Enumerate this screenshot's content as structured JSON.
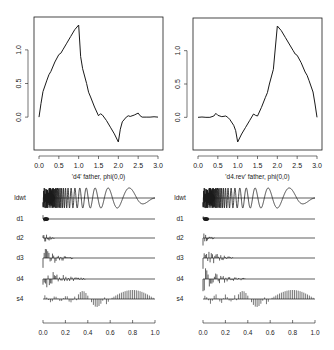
{
  "figure": {
    "background": "#ffffff",
    "ink": "#1a1a1a",
    "panels": [
      {
        "id": "top-left",
        "xlabel": "'d4' father, phi(0,0)"
      },
      {
        "id": "top-right",
        "xlabel": "'d4.rev' father, phi(0,0)"
      },
      {
        "id": "bottom-left",
        "rows": [
          "ldwt",
          "d1",
          "d2",
          "d3",
          "d4",
          "s4"
        ]
      },
      {
        "id": "bottom-right",
        "rows": [
          "ldwt",
          "d1",
          "d2",
          "d3",
          "d4",
          "s4"
        ]
      }
    ]
  },
  "chart_data": [
    {
      "type": "line",
      "title": "",
      "xlabel": "'d4' father, phi(0,0)",
      "ylabel": "",
      "xlim": [
        0,
        3
      ],
      "ylim": [
        -0.4,
        1.4
      ],
      "xticks": [
        "0.0",
        "0.5",
        "1.0",
        "1.5",
        "2.0",
        "2.5",
        "3.0"
      ],
      "yticks": [
        "0.0",
        "0.5",
        "1.0"
      ],
      "grid": false,
      "x": [
        0.0,
        0.05,
        0.1,
        0.2,
        0.25,
        0.3,
        0.4,
        0.5,
        0.55,
        0.6,
        0.7,
        0.8,
        0.9,
        1.0,
        1.05,
        1.1,
        1.2,
        1.25,
        1.3,
        1.4,
        1.5,
        1.55,
        1.6,
        1.7,
        1.8,
        1.9,
        2.0,
        2.05,
        2.1,
        2.2,
        2.25,
        2.3,
        2.4,
        2.5,
        2.55,
        2.6,
        2.7,
        2.8,
        2.9,
        3.0
      ],
      "y": [
        0.0,
        0.2,
        0.38,
        0.55,
        0.63,
        0.68,
        0.82,
        0.93,
        0.95,
        1.0,
        1.1,
        1.2,
        1.3,
        1.37,
        0.9,
        0.72,
        0.5,
        0.37,
        0.3,
        0.15,
        0.02,
        0.05,
        0.03,
        -0.05,
        -0.15,
        -0.25,
        -0.37,
        -0.18,
        -0.07,
        0.0,
        0.02,
        0.01,
        0.03,
        0.06,
        0.02,
        0.0,
        0.0,
        0.0,
        0.005,
        0.0
      ]
    },
    {
      "type": "line",
      "title": "",
      "xlabel": "'d4.rev' father, phi(0,0)",
      "ylabel": "",
      "xlim": [
        0,
        3
      ],
      "ylim": [
        -0.4,
        1.4
      ],
      "xticks": [
        "0.0",
        "0.5",
        "1.0",
        "1.5",
        "2.0",
        "2.5",
        "3.0"
      ],
      "yticks": [
        "0.0",
        "0.5",
        "1.0"
      ],
      "grid": false,
      "x": [
        0.0,
        0.1,
        0.2,
        0.3,
        0.4,
        0.45,
        0.5,
        0.6,
        0.7,
        0.75,
        0.8,
        0.9,
        0.95,
        1.0,
        1.1,
        1.2,
        1.3,
        1.4,
        1.45,
        1.5,
        1.6,
        1.7,
        1.75,
        1.8,
        1.9,
        2.0,
        2.1,
        2.2,
        2.3,
        2.4,
        2.45,
        2.5,
        2.6,
        2.7,
        2.75,
        2.8,
        2.9,
        2.95,
        3.0
      ],
      "y": [
        0.0,
        0.005,
        0.0,
        0.0,
        0.02,
        0.06,
        0.03,
        0.01,
        0.02,
        0.0,
        -0.03,
        -0.12,
        -0.2,
        -0.37,
        -0.25,
        -0.15,
        -0.05,
        0.05,
        0.03,
        0.02,
        0.15,
        0.3,
        0.37,
        0.5,
        0.72,
        1.37,
        1.3,
        1.2,
        1.1,
        1.0,
        0.95,
        0.93,
        0.82,
        0.68,
        0.63,
        0.55,
        0.38,
        0.2,
        0.0
      ]
    },
    {
      "type": "multiresolution",
      "title": "",
      "xlabel": "",
      "xlim": [
        0,
        1
      ],
      "xticks": [
        "0.0",
        "0.2",
        "0.4",
        "0.6",
        "0.8",
        "1.0"
      ],
      "rows": [
        {
          "name": "ldwt",
          "kind": "signal",
          "description": "chirp-like oscillation, frequency decreasing from x=0 to x=1"
        },
        {
          "name": "d1",
          "kind": "detail",
          "energy_end": 0.05
        },
        {
          "name": "d2",
          "kind": "detail",
          "energy_end": 0.1
        },
        {
          "name": "d3",
          "kind": "detail",
          "energy_end": 0.25
        },
        {
          "name": "d4",
          "kind": "detail",
          "energy_end": 0.35
        },
        {
          "name": "s4",
          "kind": "smooth"
        }
      ]
    },
    {
      "type": "multiresolution",
      "title": "",
      "xlabel": "",
      "xlim": [
        0,
        1
      ],
      "xticks": [
        "0.0",
        "0.2",
        "0.4",
        "0.6",
        "0.8",
        "1.0"
      ],
      "rows": [
        {
          "name": "ldwt",
          "kind": "signal",
          "description": "chirp-like oscillation, frequency decreasing from x=0 to x=1"
        },
        {
          "name": "d1",
          "kind": "detail",
          "energy_end": 0.05
        },
        {
          "name": "d2",
          "kind": "detail",
          "energy_end": 0.1
        },
        {
          "name": "d3",
          "kind": "detail",
          "energy_end": 0.25
        },
        {
          "name": "d4",
          "kind": "detail",
          "energy_end": 0.35
        },
        {
          "name": "s4",
          "kind": "smooth"
        }
      ]
    }
  ]
}
